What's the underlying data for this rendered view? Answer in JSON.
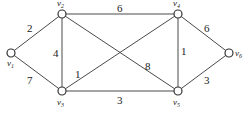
{
  "diagram": {
    "type": "weighted-undirected-graph",
    "nodes": [
      {
        "id": "v1",
        "label": "v",
        "sub": "1",
        "x": 11,
        "y": 53
      },
      {
        "id": "v2",
        "label": "v",
        "sub": "2",
        "x": 62,
        "y": 14
      },
      {
        "id": "v3",
        "label": "v",
        "sub": "3",
        "x": 62,
        "y": 91
      },
      {
        "id": "v4",
        "label": "v",
        "sub": "4",
        "x": 178,
        "y": 14
      },
      {
        "id": "v5",
        "label": "v",
        "sub": "5",
        "x": 178,
        "y": 91
      },
      {
        "id": "v6",
        "label": "v",
        "sub": "6",
        "x": 229,
        "y": 53
      }
    ],
    "edges": [
      {
        "from": "v1",
        "to": "v2",
        "weight": "2"
      },
      {
        "from": "v1",
        "to": "v3",
        "weight": "7"
      },
      {
        "from": "v2",
        "to": "v3",
        "weight": "4"
      },
      {
        "from": "v2",
        "to": "v4",
        "weight": "6"
      },
      {
        "from": "v2",
        "to": "v5",
        "weight": "8"
      },
      {
        "from": "v3",
        "to": "v4",
        "weight": "1"
      },
      {
        "from": "v3",
        "to": "v5",
        "weight": "3"
      },
      {
        "from": "v4",
        "to": "v5",
        "weight": "1"
      },
      {
        "from": "v4",
        "to": "v6",
        "weight": "6"
      },
      {
        "from": "v5",
        "to": "v6",
        "weight": "3"
      }
    ]
  }
}
